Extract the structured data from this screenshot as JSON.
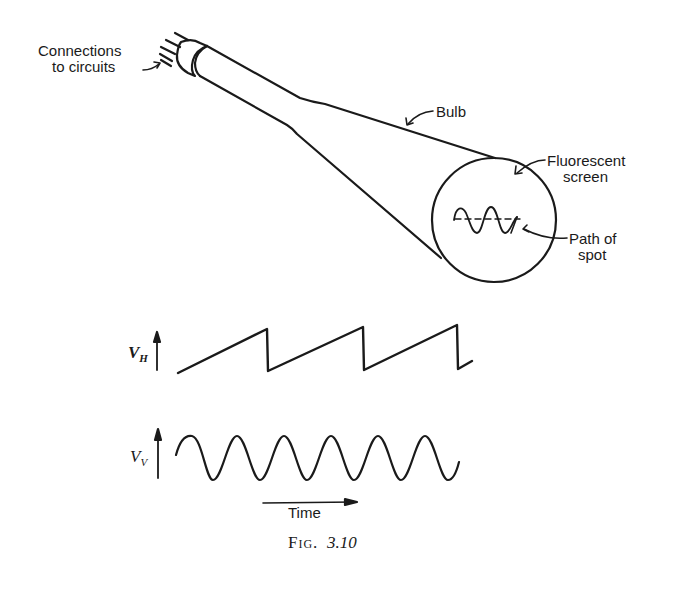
{
  "figure": {
    "caption_prefix": "Fig.",
    "caption_number": "3.10",
    "labels": {
      "connections": [
        "Connections",
        "to circuits"
      ],
      "bulb": "Bulb",
      "screen": [
        "Fluorescent",
        "screen"
      ],
      "path": [
        "Path of",
        "spot"
      ]
    },
    "waveforms": {
      "horizontal": {
        "symbol": "V",
        "subscript": "H",
        "shape": "sawtooth",
        "cycles": 3
      },
      "vertical": {
        "symbol": "V",
        "subscript": "V",
        "shape": "sine",
        "cycles": 6
      },
      "time_axis_label": "Time"
    },
    "colors": {
      "ink": "#1a1a1a",
      "background": "#ffffff"
    }
  }
}
